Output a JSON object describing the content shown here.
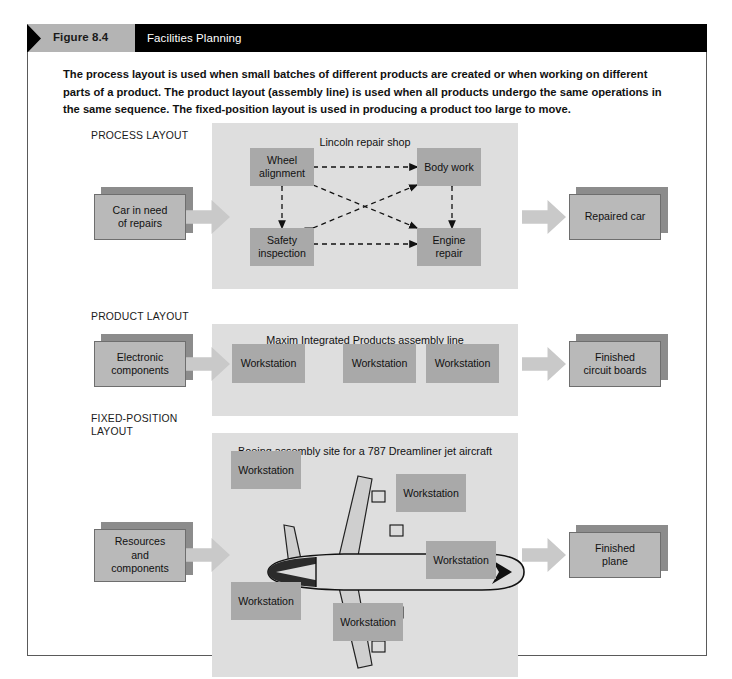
{
  "figure": {
    "tab_label": "Figure 8.4",
    "title": "Facilities Planning",
    "intro": "The process layout is used when small batches of different products are created or when working on different parts of a product. The product layout (assembly line) is used when all products undergo the same operations in the same sequence. The fixed-position layout is used in producing a product too large to move."
  },
  "colors": {
    "header_bar": "#000000",
    "tab_background": "#b4b4b4",
    "panel_background": "#dedede",
    "box_fill": "#a9a9a9",
    "box3d_front": "#b9b9b9",
    "box3d_side": "#8c8c8c",
    "arrow_fill": "#c9c9c9",
    "frame_border": "#5a5a5a"
  },
  "sections": [
    {
      "label": "PROCESS LAYOUT",
      "panel_caption": "Lincoln repair shop",
      "input_box": "Car in need\nof repairs",
      "output_box": "Repaired car",
      "nodes": [
        "Wheel\nalignment",
        "Body work",
        "Safety\ninspection",
        "Engine\nrepair"
      ],
      "connector_style": "dashed double-headed arrows between all four nodes"
    },
    {
      "label": "PRODUCT LAYOUT",
      "panel_caption": "Maxim Integrated Products assembly line",
      "input_box": "Electronic\ncomponents",
      "output_box": "Finished\ncircuit boards",
      "nodes": [
        "Workstation",
        "Workstation",
        "Workstation"
      ],
      "connector_style": "solid single-headed arrows left to right"
    },
    {
      "label": "FIXED-POSITION\nLAYOUT",
      "panel_caption": "Boeing assembly site for a 787 Dreamliner jet aircraft",
      "input_box": "Resources\nand\ncomponents",
      "output_box": "Finished\nplane",
      "nodes": [
        "Workstation",
        "Workstation",
        "Workstation",
        "Workstation",
        "Workstation"
      ],
      "center_graphic": "airplane-top-view"
    }
  ]
}
